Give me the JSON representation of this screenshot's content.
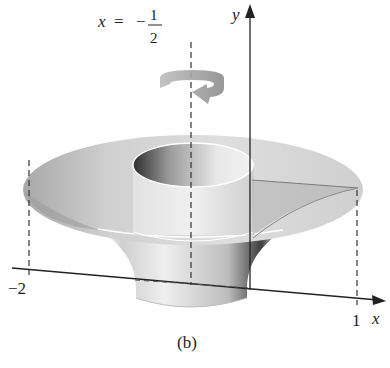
{
  "figure": {
    "caption": "(b)",
    "axis_of_rotation": {
      "lhs": "x",
      "equals": "=",
      "sign": "−",
      "numerator": "1",
      "denominator": "2"
    },
    "axes": {
      "x_label": "x",
      "y_label": "y"
    },
    "tick_labels": {
      "left": "−2",
      "right": "1"
    },
    "icons": {
      "rotation_arrow": "circular-rotation-arrow"
    },
    "colors": {
      "surface_light": "#e6e6e6",
      "surface_mid": "#c4c4c4",
      "surface_dark": "#7a7a7a",
      "axis": "#222222",
      "dash": "#333333"
    }
  }
}
